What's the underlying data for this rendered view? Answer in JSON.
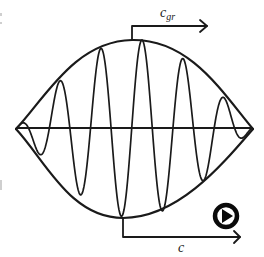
{
  "diagram": {
    "labels": {
      "group_velocity_symbol": "c",
      "group_velocity_subscript": "gr",
      "phase_velocity_symbol": "c"
    },
    "colors": {
      "line": "#1a1a1a",
      "background": "#ffffff"
    },
    "icons": {
      "play": "play-circle-icon"
    }
  }
}
